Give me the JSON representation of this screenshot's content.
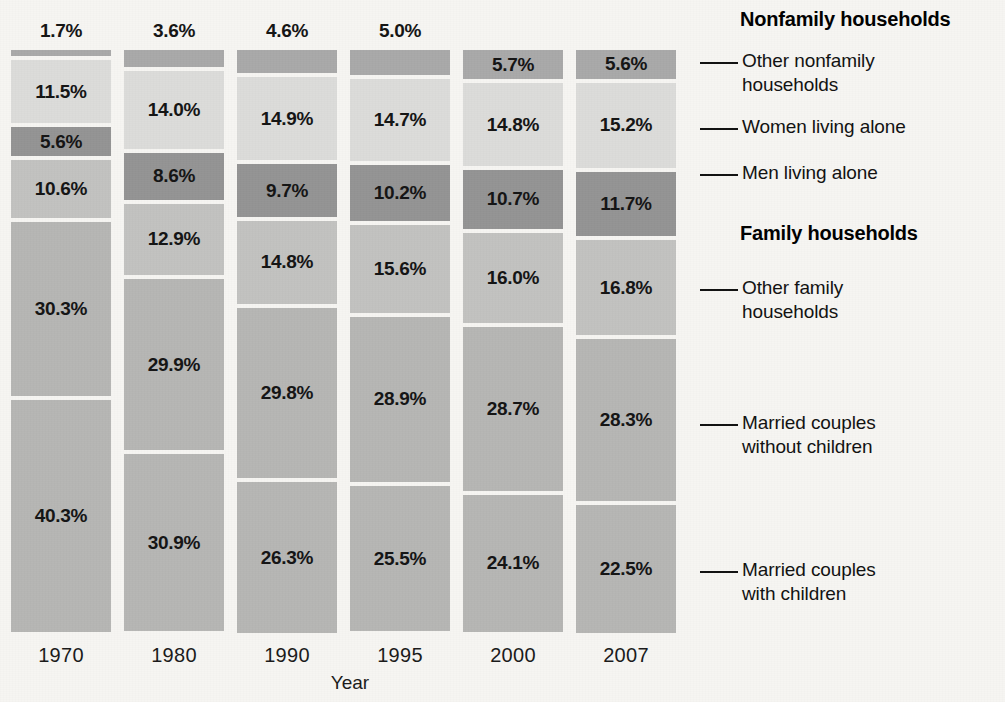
{
  "chart_data": {
    "type": "bar",
    "subtype": "stacked-bar-100-percent",
    "title": "",
    "xlabel": "Year",
    "ylabel": "",
    "ylim": [
      0,
      100
    ],
    "grid": false,
    "legend_position": "right-callouts",
    "categories": [
      "1970",
      "1980",
      "1990",
      "1995",
      "2000",
      "2007"
    ],
    "series": [
      {
        "name": "Other nonfamily households",
        "group": "Nonfamily households",
        "color": "#a9a9a9",
        "values": [
          1.7,
          3.6,
          4.6,
          5.0,
          5.7,
          5.6
        ],
        "labels": [
          "1.7%",
          "3.6%",
          "4.6%",
          "5.0%",
          "5.7%",
          "5.6%"
        ]
      },
      {
        "name": "Women living alone",
        "group": "Nonfamily households",
        "color": "#dcdcda",
        "values": [
          11.5,
          14.0,
          14.9,
          14.7,
          14.8,
          15.2
        ],
        "labels": [
          "11.5%",
          "14.0%",
          "14.9%",
          "14.7%",
          "14.8%",
          "15.2%"
        ]
      },
      {
        "name": "Men living alone",
        "group": "Nonfamily households",
        "color": "#949494",
        "values": [
          5.6,
          8.6,
          9.7,
          10.2,
          10.7,
          11.7
        ],
        "labels": [
          "5.6%",
          "8.6%",
          "9.7%",
          "10.2%",
          "10.7%",
          "11.7%"
        ]
      },
      {
        "name": "Other family households",
        "group": "Family households",
        "color": "#c2c2c0",
        "values": [
          10.6,
          12.9,
          14.8,
          15.6,
          16.0,
          16.8
        ],
        "labels": [
          "10.6%",
          "12.9%",
          "14.8%",
          "15.6%",
          "16.0%",
          "16.8%"
        ]
      },
      {
        "name": "Married couples without children",
        "group": "Family households",
        "color": "#b6b6b4",
        "values": [
          30.3,
          29.9,
          29.8,
          28.9,
          28.7,
          28.3
        ],
        "labels": [
          "30.3%",
          "29.9%",
          "29.8%",
          "28.9%",
          "28.7%",
          "28.3%"
        ]
      },
      {
        "name": "Married couples with children",
        "group": "Family households",
        "color": "#b6b6b4",
        "values": [
          40.3,
          30.9,
          26.3,
          25.5,
          24.1,
          22.5
        ],
        "labels": [
          "40.3%",
          "30.9%",
          "26.3%",
          "25.5%",
          "24.1%",
          "22.5%"
        ]
      }
    ]
  },
  "axis": {
    "x_title": "Year",
    "tick_labels": [
      "1970",
      "1980",
      "1990",
      "1995",
      "2000",
      "2007"
    ]
  },
  "legend": {
    "groups": [
      {
        "title": "Nonfamily households"
      },
      {
        "title": "Family households"
      }
    ],
    "entries": [
      {
        "label_line1": "Other nonfamily",
        "label_line2": "households"
      },
      {
        "label_line1": "Women living alone",
        "label_line2": ""
      },
      {
        "label_line1": "Men living alone",
        "label_line2": ""
      },
      {
        "label_line1": "Other family",
        "label_line2": "households"
      },
      {
        "label_line1": "Married couples",
        "label_line2": "without children"
      },
      {
        "label_line1": "Married couples",
        "label_line2": "with children"
      }
    ]
  },
  "colors": {
    "background": "#f6f5f2",
    "text": "#111111",
    "segment_other_nonfamily": "#a9a9a9",
    "segment_women_alone": "#dcdcda",
    "segment_men_alone": "#949494",
    "segment_other_family": "#c2c2c0",
    "segment_married_no_children": "#b6b6b4",
    "segment_married_with_children": "#b6b6b4"
  }
}
